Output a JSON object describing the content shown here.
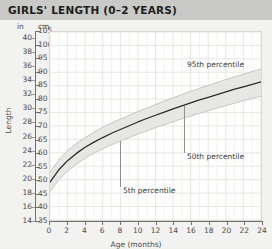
{
  "header": {
    "title": "GIRLS' LENGTH (0–2 YEARS)"
  },
  "axes": {
    "unit_left": "in",
    "unit_right": "cm",
    "y_title": "Length",
    "x_title": "Age (months)"
  },
  "chart_data": {
    "type": "line",
    "title": "GIRLS' LENGTH (0–2 YEARS)",
    "xlabel": "Age (months)",
    "ylabel": "Length",
    "grid": true,
    "legend": "none",
    "xlim": [
      0,
      24
    ],
    "xticks": [
      0,
      2,
      4,
      6,
      8,
      10,
      12,
      14,
      16,
      18,
      20,
      22,
      24
    ],
    "y_primary_unit": "cm",
    "ylim_cm": [
      35,
      105
    ],
    "yticks_cm": [
      35,
      40,
      45,
      50,
      55,
      60,
      65,
      70,
      75,
      80,
      85,
      90,
      95,
      100,
      105
    ],
    "y_secondary_unit": "in",
    "ylim_in": [
      14,
      41
    ],
    "yticks_in": [
      14,
      16,
      18,
      20,
      22,
      24,
      26,
      28,
      30,
      32,
      34,
      36,
      38,
      40
    ],
    "x": [
      0,
      1,
      2,
      3,
      4,
      5,
      6,
      7,
      8,
      9,
      10,
      11,
      12,
      13,
      14,
      15,
      16,
      17,
      18,
      19,
      20,
      21,
      22,
      23,
      24
    ],
    "series": [
      {
        "name": "50th percentile",
        "unit": "cm",
        "values": [
          49.1,
          53.7,
          57.1,
          59.8,
          62.1,
          64.0,
          65.7,
          67.3,
          68.7,
          70.1,
          71.5,
          72.8,
          74.0,
          75.2,
          76.4,
          77.5,
          78.6,
          79.7,
          80.7,
          81.7,
          82.7,
          83.7,
          84.6,
          85.5,
          86.4
        ]
      },
      {
        "name": "95th percentile",
        "unit": "cm",
        "values": [
          52.7,
          57.4,
          60.9,
          63.5,
          65.7,
          67.7,
          69.5,
          71.1,
          72.6,
          74.0,
          75.4,
          76.7,
          78.0,
          79.3,
          80.5,
          81.7,
          82.9,
          84.0,
          85.1,
          86.2,
          87.3,
          88.3,
          89.3,
          90.3,
          91.2
        ]
      },
      {
        "name": "5th percentile",
        "unit": "cm",
        "values": [
          45.6,
          50.0,
          53.2,
          55.8,
          58.0,
          59.9,
          61.5,
          63.0,
          64.4,
          65.7,
          67.0,
          68.2,
          69.4,
          70.5,
          71.6,
          72.7,
          73.7,
          74.7,
          75.7,
          76.7,
          77.6,
          78.5,
          79.4,
          80.3,
          81.1
        ]
      }
    ],
    "annotations": [
      {
        "text": "95th percentile",
        "x": 15.2,
        "y_cm": 93.0
      },
      {
        "text": "50th percentile",
        "x": 15.2,
        "y_cm": 59.0
      },
      {
        "text": "5th percentile",
        "x": 8.0,
        "y_cm": 46.5
      }
    ]
  }
}
